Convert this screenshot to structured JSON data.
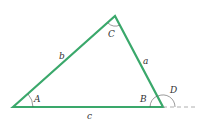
{
  "diagram": {
    "type": "triangle",
    "stroke_color": "#3aa86b",
    "vertices": {
      "A": {
        "x": 13,
        "y": 107,
        "label": "A"
      },
      "B": {
        "x": 163,
        "y": 107,
        "label": "B"
      },
      "C": {
        "x": 115,
        "y": 16,
        "label": "C"
      }
    },
    "sides": {
      "a": "a",
      "b": "b",
      "c": "c"
    },
    "exterior_angle": {
      "label": "D"
    }
  }
}
